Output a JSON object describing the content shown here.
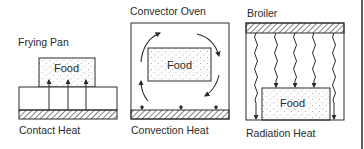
{
  "panels": [
    {
      "title": "Frying Pan",
      "food_label": "Food",
      "caption": "Contact Heat"
    },
    {
      "title": "Convector Oven",
      "food_label": "Food",
      "caption": "Convection Heat"
    },
    {
      "title": "Broiler",
      "food_label": "Food",
      "caption": "Radiation Heat"
    }
  ],
  "colors": {
    "line": "#2a2a2a",
    "background": "#ffffff"
  }
}
